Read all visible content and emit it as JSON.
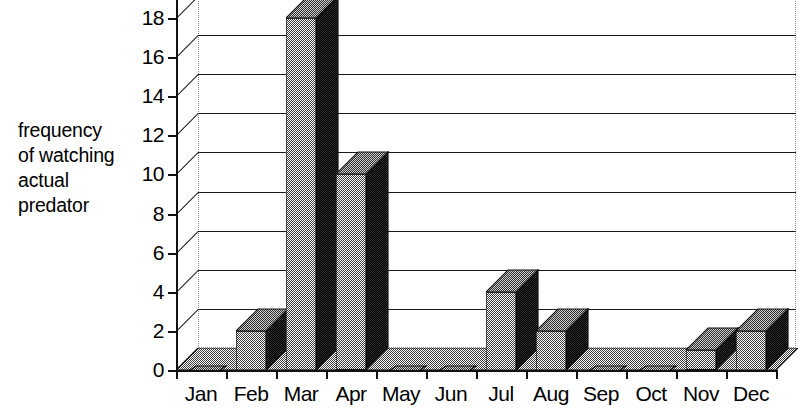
{
  "chart_data": {
    "type": "bar",
    "title": "",
    "subtitle": "",
    "xlabel": "",
    "ylabel": "frequency\nof watching\nactual\npredator",
    "categories": [
      "Jan",
      "Feb",
      "Mar",
      "Apr",
      "May",
      "Jun",
      "Jul",
      "Aug",
      "Sep",
      "Oct",
      "Nov",
      "Dec"
    ],
    "values": [
      0,
      2,
      18,
      10,
      0,
      0,
      4,
      2,
      0,
      0,
      1,
      2
    ],
    "ylim": [
      0,
      18
    ],
    "y_ticks": [
      0,
      2,
      4,
      6,
      8,
      10,
      12,
      14,
      16,
      18
    ],
    "y_tick_labels": [
      "0",
      "2",
      "4",
      "6",
      "8",
      "10",
      "12",
      "14",
      "16",
      "18"
    ],
    "grid": true,
    "legend": false,
    "legend_position": "none",
    "style": "3d-columns",
    "annotations": []
  },
  "axis": {
    "y_title_lines": [
      "frequency",
      "of watching",
      "actual",
      "predator"
    ],
    "y_title_text": "frequency\nof watching\nactual\npredator"
  },
  "colors": {
    "bar_front": "#8f8f8f",
    "bar_top": "#6d6d6d",
    "bar_side": "#2a2a2a",
    "bar_outline": "#111111",
    "floor": "#9a9a9a",
    "gridline": "#1a1a1a",
    "back_wall_border": "#8a8a8a",
    "axis": "#111111",
    "text": "#000000",
    "background": "#ffffff"
  }
}
